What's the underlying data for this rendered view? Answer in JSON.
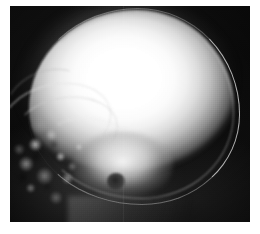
{
  "figure": {
    "kind": "radiograph",
    "modality": "X-ray",
    "view": "lateral",
    "anatomy": "skull",
    "caption": "",
    "has_text": false,
    "has_labels": false,
    "has_annotations": false
  },
  "frame": {
    "page_background": "#ffffff",
    "margin_left_px": 10,
    "margin_top_px": 6,
    "plate_width_px": 240,
    "plate_height_px": 216
  },
  "colors": {
    "background": "#ffffff",
    "film_base": "#0a0a0a",
    "film_dark": "#121212",
    "bone_bright": "#ffffff",
    "bone_mid": "#bdbdbd",
    "bone_dim": "#5d5d5d",
    "cortex_line": "#e8e8e8",
    "lucency_dark": "#1c1c1c"
  },
  "regions": [
    {
      "name": "cranial-vault",
      "label": "Cranial vault",
      "description": "Large saturated white ovoid occupying the upper two thirds of the film",
      "brightness": "saturated-white"
    },
    {
      "name": "calvarial-cortex",
      "label": "Calvarial cortex",
      "description": "Bright double line of outer and inner tables arcing along the posterior margin",
      "brightness": "bright"
    },
    {
      "name": "diploic-space",
      "label": "Diploic space",
      "description": "Thin darker stripe between the inner and outer tables",
      "brightness": "dark"
    },
    {
      "name": "orbital-roof-arc",
      "label": "Orbital roof",
      "description": "Sweeping bright arc in the anterior third",
      "brightness": "bright"
    },
    {
      "name": "sphenoid-ridge-arc",
      "label": "Sphenoid ridge",
      "description": "Second curved line below and parallel to the orbital roof",
      "brightness": "mid-bright"
    },
    {
      "name": "petrous-ridge-arc",
      "label": "Petrous ridge",
      "description": "Broad bright band crossing the central skull base",
      "brightness": "bright"
    },
    {
      "name": "facial-skeleton",
      "label": "Facial bones",
      "description": "Mottled trabecular bone detail filling the lower left quadrant",
      "brightness": "mottled"
    },
    {
      "name": "skull-base",
      "label": "Skull base",
      "description": "Bright confluence of dense bone at the centre of the lower half",
      "brightness": "bright"
    },
    {
      "name": "external-auditory-canal",
      "label": "External auditory canal",
      "description": "Small round dark lucency at the centre of the skull base",
      "brightness": "dark"
    },
    {
      "name": "mandible-shadow",
      "label": "Mandible and soft tissue",
      "description": "Faint grey band sweeping across the lower margin",
      "brightness": "dim"
    },
    {
      "name": "film-background",
      "label": "Film background",
      "description": "Near black unexposed film surrounding the head",
      "brightness": "black"
    }
  ]
}
